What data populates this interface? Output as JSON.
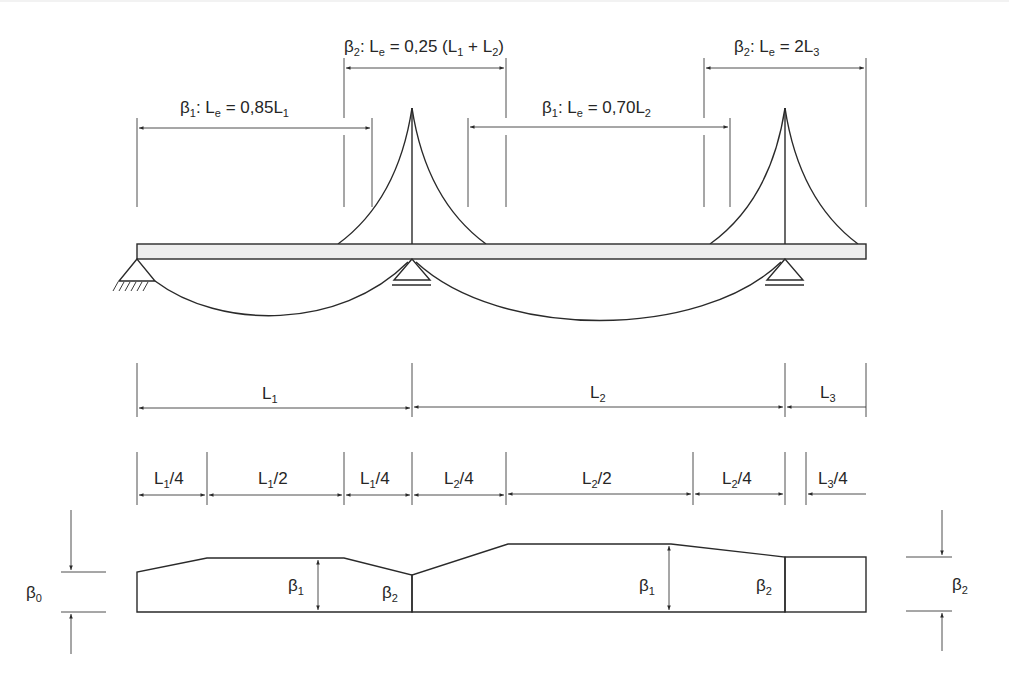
{
  "diagram": {
    "effective_lengths": [
      {
        "beta": "β",
        "beta_sub": "1",
        "text": ": L",
        "text_sub": "e",
        "rest": " = 0,85L",
        "rest_sub": "1",
        "tail": ""
      },
      {
        "beta": "β",
        "beta_sub": "2",
        "text": ": L",
        "text_sub": "e",
        "rest": " = 0,25 (L",
        "rest_sub": "1",
        "tail": " + L",
        "tail_sub": "2",
        "close": ")"
      },
      {
        "beta": "β",
        "beta_sub": "1",
        "text": ": L",
        "text_sub": "e",
        "rest": " = 0,70L",
        "rest_sub": "2",
        "tail": ""
      },
      {
        "beta": "β",
        "beta_sub": "2",
        "text": ": L",
        "text_sub": "e",
        "rest": " = 2L",
        "rest_sub": "3",
        "tail": ""
      }
    ],
    "spans": [
      {
        "main": "L",
        "sub": "1"
      },
      {
        "main": "L",
        "sub": "2"
      },
      {
        "main": "L",
        "sub": "3"
      }
    ],
    "sub_spans": [
      {
        "main": "L",
        "sub": "1",
        "frac": "/4"
      },
      {
        "main": "L",
        "sub": "1",
        "frac": "/2"
      },
      {
        "main": "L",
        "sub": "1",
        "frac": "/4"
      },
      {
        "main": "L",
        "sub": "2",
        "frac": "/4"
      },
      {
        "main": "L",
        "sub": "2",
        "frac": "/2"
      },
      {
        "main": "L",
        "sub": "2",
        "frac": "/4"
      },
      {
        "main": "L",
        "sub": "3",
        "frac": "/4"
      }
    ],
    "beta_labels": {
      "left_dim": {
        "main": "β",
        "sub": "0"
      },
      "span1_b1": {
        "main": "β",
        "sub": "1"
      },
      "span1_b2": {
        "main": "β",
        "sub": "2"
      },
      "span2_b1": {
        "main": "β",
        "sub": "1"
      },
      "span2_b2": {
        "main": "β",
        "sub": "2"
      },
      "right_dim": {
        "main": "β",
        "sub": "2"
      }
    },
    "colors": {
      "line": "#2a2a2a",
      "deck_fill": "#eeeeee",
      "text": "#262626"
    }
  }
}
